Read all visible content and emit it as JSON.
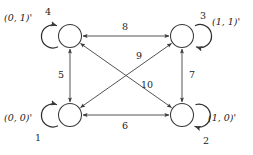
{
  "diagram": {
    "type": "state-transition-graph",
    "background_color": "#ffffff",
    "line_color": "#4a4a4a",
    "text_color": "#1c1c1c",
    "nodes": [
      {
        "id": "top-left",
        "state_label": "(0, 1)'",
        "self_loop_label": "4",
        "cx": 70,
        "cy": 36
      },
      {
        "id": "top-right",
        "state_label": "(1, 1)'",
        "self_loop_label": "3",
        "cx": 182,
        "cy": 36
      },
      {
        "id": "bottom-left",
        "state_label": "(0, 0)'",
        "self_loop_label": "1",
        "cx": 70,
        "cy": 115
      },
      {
        "id": "bottom-right",
        "state_label": "(1, 0)'",
        "self_loop_label": "2",
        "cx": 182,
        "cy": 115
      }
    ],
    "edges": [
      {
        "id": "edge-top",
        "label": "8",
        "from": "top-left",
        "to": "top-right",
        "direction": "both"
      },
      {
        "id": "edge-bottom",
        "label": "6",
        "from": "bottom-left",
        "to": "bottom-right",
        "direction": "both"
      },
      {
        "id": "edge-left",
        "label": "5",
        "from": "top-left",
        "to": "bottom-left",
        "direction": "both"
      },
      {
        "id": "edge-right",
        "label": "7",
        "from": "top-right",
        "to": "bottom-right",
        "direction": "both"
      },
      {
        "id": "edge-diagonal-up",
        "label": "9",
        "from": "bottom-left",
        "to": "top-right",
        "direction": "both"
      },
      {
        "id": "edge-diagonal-down",
        "label": "10",
        "from": "top-left",
        "to": "bottom-right",
        "direction": "both"
      }
    ]
  }
}
